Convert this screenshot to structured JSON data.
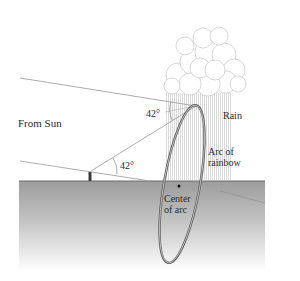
{
  "diagram": {
    "labels": {
      "from_sun": "From Sun",
      "rain": "Rain",
      "arc_of_rainbow_line1": "Arc of",
      "arc_of_rainbow_line2": "rainbow",
      "center_of_arc_line1": "Center",
      "center_of_arc_line2": "of arc",
      "angle_top": "42°",
      "angle_observer": "42°"
    },
    "angle_degrees": 42,
    "colors": {
      "ground_top": "#9a9a9a",
      "ground_bottom": "#ffffff",
      "ray": "#9a9a9a",
      "rainbow": "#555555",
      "cloud": "#c8c8c8",
      "rain": "#bdbdbd",
      "text": "#2a2a2a"
    }
  }
}
